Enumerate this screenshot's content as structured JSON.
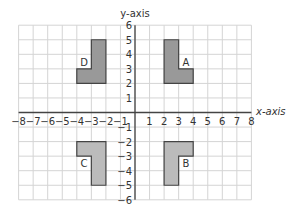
{
  "diagram": {
    "x_axis_label": "x-axis",
    "y_axis_label": "y-axis",
    "x_range": [
      -8,
      8
    ],
    "y_range": [
      -6,
      6
    ],
    "x_ticks": [
      "-8",
      "-7",
      "-6",
      "-5",
      "-4",
      "-3",
      "-2",
      "-1",
      "1",
      "2",
      "3",
      "4",
      "5",
      "6",
      "7",
      "8"
    ],
    "y_ticks": [
      "6",
      "5",
      "4",
      "3",
      "2",
      "1",
      "-1",
      "-2",
      "-3",
      "-4",
      "-5",
      "-6"
    ],
    "grid_color": "#d4d4d4",
    "axis_color": "#444444",
    "shapes": [
      {
        "label": "A",
        "fill": "#999999",
        "vertices": [
          [
            2,
            5
          ],
          [
            3,
            5
          ],
          [
            3,
            3
          ],
          [
            4,
            3
          ],
          [
            4,
            2
          ],
          [
            2,
            2
          ]
        ],
        "label_pos": [
          3.5,
          3.5
        ]
      },
      {
        "label": "B",
        "fill": "#bbbbbb",
        "vertices": [
          [
            2,
            -2
          ],
          [
            4,
            -2
          ],
          [
            4,
            -3
          ],
          [
            3,
            -3
          ],
          [
            3,
            -5
          ],
          [
            2,
            -5
          ]
        ],
        "label_pos": [
          3.5,
          -3.5
        ]
      },
      {
        "label": "C",
        "fill": "#bbbbbb",
        "vertices": [
          [
            -4,
            -2
          ],
          [
            -2,
            -2
          ],
          [
            -2,
            -5
          ],
          [
            -3,
            -5
          ],
          [
            -3,
            -3
          ],
          [
            -4,
            -3
          ]
        ],
        "label_pos": [
          -3.5,
          -3.5
        ]
      },
      {
        "label": "D",
        "fill": "#999999",
        "vertices": [
          [
            -3,
            5
          ],
          [
            -2,
            5
          ],
          [
            -2,
            2
          ],
          [
            -4,
            2
          ],
          [
            -4,
            3
          ],
          [
            -3,
            3
          ]
        ],
        "label_pos": [
          -3.5,
          3.5
        ]
      }
    ]
  }
}
